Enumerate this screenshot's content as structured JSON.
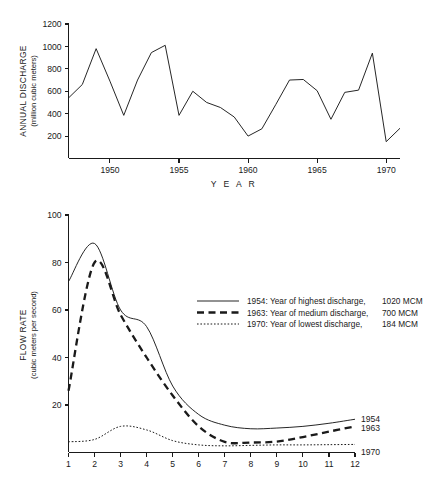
{
  "figure": {
    "background": "#ffffff",
    "ink_color": "#1a1a1a"
  },
  "chart_data": [
    {
      "id": "annual-discharge",
      "type": "line",
      "title": "",
      "xlabel": "Y E A R",
      "ylabel": "ANNUAL DISCHARGE",
      "ylabel_sub": "(million cubic meters)",
      "xlim": [
        1947,
        1971
      ],
      "ylim": [
        0,
        1200
      ],
      "grid": false,
      "legend": "none",
      "ytick_labels": [
        "1200",
        "1000",
        "800",
        "600",
        "400",
        "200"
      ],
      "yticks": [
        1200,
        1000,
        800,
        600,
        400,
        200
      ],
      "xtick_labels": [
        "1950",
        "1955",
        "1960",
        "1965",
        "1970"
      ],
      "xticks": [
        1950,
        1955,
        1960,
        1965,
        1970
      ],
      "x": [
        1947,
        1948,
        1949,
        1950,
        1951,
        1952,
        1953,
        1954,
        1955,
        1956,
        1957,
        1958,
        1959,
        1960,
        1961,
        1962,
        1963,
        1964,
        1965,
        1966,
        1967,
        1968,
        1969,
        1970,
        1971
      ],
      "values": [
        540,
        660,
        980,
        690,
        385,
        700,
        945,
        1010,
        385,
        600,
        500,
        455,
        370,
        200,
        265,
        480,
        700,
        705,
        605,
        350,
        590,
        610,
        940,
        150,
        270
      ],
      "series": [
        {
          "name": "Annual discharge",
          "style": "solid",
          "values": [
            540,
            660,
            980,
            690,
            385,
            700,
            945,
            1010,
            385,
            600,
            500,
            455,
            370,
            200,
            265,
            480,
            700,
            705,
            605,
            350,
            590,
            610,
            940,
            150,
            270
          ]
        }
      ]
    },
    {
      "id": "monthly-flow-rate",
      "type": "line",
      "title": "",
      "xlabel": "",
      "ylabel": "FLOW RATE",
      "ylabel_sub": "(cubic meters per second)",
      "xlim": [
        1,
        12
      ],
      "ylim": [
        0,
        100
      ],
      "grid": false,
      "legend": "inside-upper-right",
      "ytick_labels": [
        "100",
        "80",
        "60",
        "40",
        "20"
      ],
      "yticks": [
        100,
        80,
        60,
        40,
        20
      ],
      "xtick_labels": [
        "1",
        "2",
        "3",
        "4",
        "5",
        "6",
        "7",
        "8",
        "9",
        "10",
        "11",
        "12"
      ],
      "xticks": [
        1,
        2,
        3,
        4,
        5,
        6,
        7,
        8,
        9,
        10,
        11,
        12
      ],
      "categories": [
        1,
        2,
        3,
        4,
        5,
        6,
        7,
        8,
        9,
        10,
        11,
        12
      ],
      "series": [
        {
          "name": "1954",
          "style": "solid",
          "legend_label": "1954: Year of highest discharge, 1020 MCM",
          "year": "1954",
          "descriptor": "Year of highest discharge,",
          "volume": "1020 MCM",
          "end_label": "1954",
          "values": [
            72,
            88,
            60,
            53,
            28,
            16,
            11.5,
            10,
            10.3,
            11,
            12.3,
            14
          ]
        },
        {
          "name": "1963",
          "style": "dashed",
          "legend_label": "1963: Year of medium discharge, 700 MCM",
          "year": "1963",
          "descriptor": "Year of medium discharge,",
          "volume": "700 MCM",
          "end_label": "1963",
          "values": [
            26,
            80,
            58,
            40,
            24,
            11,
            4.5,
            4.2,
            4.6,
            6.5,
            8.8,
            11
          ]
        },
        {
          "name": "1970",
          "style": "dotted",
          "legend_label": "1970: Year of lowest discharge, 184 MCM",
          "year": "1970",
          "descriptor": "Year of lowest discharge,",
          "volume": "184 MCM",
          "end_label": "1970",
          "values": [
            4.5,
            5.5,
            11,
            9.5,
            5,
            3.2,
            2.8,
            3.0,
            3.2,
            3.2,
            3.3,
            3.4
          ]
        }
      ]
    }
  ]
}
